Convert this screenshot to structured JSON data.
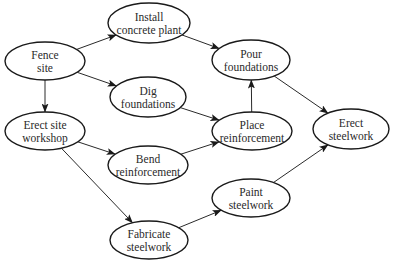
{
  "diagram": {
    "type": "activity-network",
    "colors": {
      "stroke": "#1a1a1a",
      "text": "#2a2a2a",
      "background": "#ffffff"
    },
    "nodes": [
      {
        "id": "fence-site",
        "lines": [
          "Fence",
          "site"
        ]
      },
      {
        "id": "install-concrete-plant",
        "lines": [
          "Install",
          "concrete plant"
        ]
      },
      {
        "id": "dig-foundations",
        "lines": [
          "Dig",
          "foundations"
        ]
      },
      {
        "id": "erect-site-workshop",
        "lines": [
          "Erect site",
          "workshop"
        ]
      },
      {
        "id": "bend-reinforcement",
        "lines": [
          "Bend",
          "reinforcement"
        ]
      },
      {
        "id": "fabricate-steelwork",
        "lines": [
          "Fabricate",
          "steelwork"
        ]
      },
      {
        "id": "pour-foundations",
        "lines": [
          "Pour",
          "foundations"
        ]
      },
      {
        "id": "place-reinforcement",
        "lines": [
          "Place",
          "reinforcement"
        ]
      },
      {
        "id": "paint-steelwork",
        "lines": [
          "Paint",
          "steelwork"
        ]
      },
      {
        "id": "erect-steelwork",
        "lines": [
          "Erect",
          "steelwork"
        ]
      }
    ],
    "edges": [
      {
        "from": "fence-site",
        "to": "install-concrete-plant"
      },
      {
        "from": "fence-site",
        "to": "dig-foundations"
      },
      {
        "from": "fence-site",
        "to": "erect-site-workshop"
      },
      {
        "from": "install-concrete-plant",
        "to": "pour-foundations"
      },
      {
        "from": "dig-foundations",
        "to": "place-reinforcement"
      },
      {
        "from": "erect-site-workshop",
        "to": "bend-reinforcement"
      },
      {
        "from": "erect-site-workshop",
        "to": "fabricate-steelwork"
      },
      {
        "from": "bend-reinforcement",
        "to": "place-reinforcement"
      },
      {
        "from": "place-reinforcement",
        "to": "pour-foundations"
      },
      {
        "from": "pour-foundations",
        "to": "erect-steelwork"
      },
      {
        "from": "fabricate-steelwork",
        "to": "paint-steelwork"
      },
      {
        "from": "paint-steelwork",
        "to": "erect-steelwork"
      }
    ]
  }
}
